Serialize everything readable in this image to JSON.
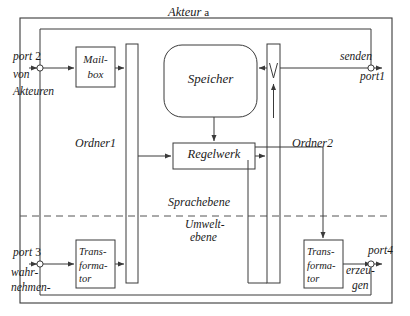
{
  "diagram": {
    "title_italic_part": "Akteur",
    "title_upright_part": "a",
    "type": "block-diagram",
    "language": "de",
    "colors": {
      "stroke": "#3a3a3a",
      "text": "#1a1a1a",
      "background": "#ffffff",
      "divider": "#555555"
    }
  },
  "top_clipped_text": "",
  "boxes": {
    "mailbox": {
      "line1": "Mail-",
      "line2": "box"
    },
    "speicher": {
      "label": "Speicher"
    },
    "regelwerk": {
      "label": "Regelwerk"
    },
    "transformator_left": {
      "line1": "Trans-",
      "line2": "forma-",
      "line3": "tor"
    },
    "transformator_right": {
      "line1": "Trans-",
      "line2": "forma-",
      "line3": "tor"
    }
  },
  "folders": {
    "ordner1": {
      "label": "Ordner1"
    },
    "ordner2": {
      "label": "Ordner2"
    }
  },
  "layers": {
    "upper": {
      "label": "Sprachebene"
    },
    "lower": {
      "line1": "Umwelt-",
      "line2": "ebene"
    }
  },
  "ports": {
    "port1": {
      "name": "port1",
      "action": "senden",
      "direction": "out",
      "side": "right-top"
    },
    "port2": {
      "name_italic": "port",
      "name_number": "2",
      "name": "port 2",
      "action_line1": "von",
      "action_line2": "Akteuren",
      "direction": "in",
      "side": "left-top"
    },
    "port3": {
      "name_italic": "port",
      "name_number": "3",
      "name": "port 3",
      "action_line1": "wahr-",
      "action_line2": "nehmen-",
      "direction": "in",
      "side": "left-bottom"
    },
    "port4": {
      "name": "port4",
      "action_line1": "erzeu-",
      "action_line2": "gen",
      "direction": "out",
      "side": "right-bottom"
    }
  }
}
